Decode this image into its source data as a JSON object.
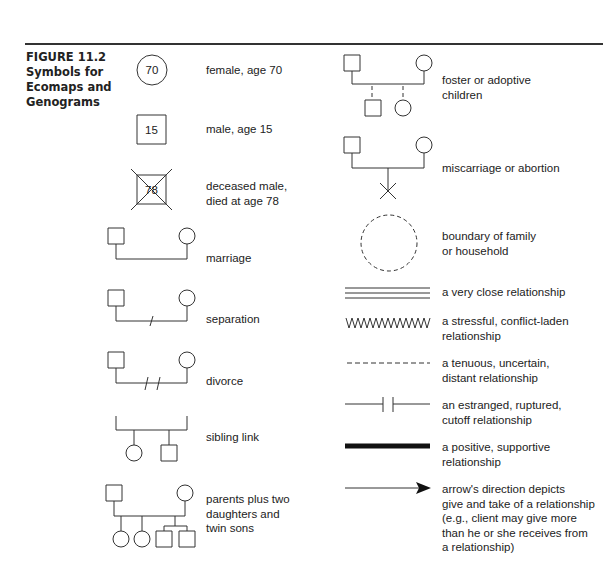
{
  "figure": {
    "number": "FIGURE 11.2",
    "title": "Symbols for Ecomaps and Genograms"
  },
  "left_column": [
    {
      "id": "female",
      "symbol": "circle",
      "symbol_text": "70",
      "label": "female, age 70"
    },
    {
      "id": "male",
      "symbol": "square",
      "symbol_text": "15",
      "label": "male, age 15"
    },
    {
      "id": "deceased",
      "symbol": "square-crossed",
      "symbol_text": "78",
      "label_lines": [
        "deceased male,",
        "died at age 78"
      ]
    },
    {
      "id": "marriage",
      "symbol": "marriage-line",
      "label": "marriage"
    },
    {
      "id": "separation",
      "symbol": "marriage-line-single-slash",
      "label": "separation"
    },
    {
      "id": "divorce",
      "symbol": "marriage-line-double-slash",
      "label": "divorce"
    },
    {
      "id": "sibling",
      "symbol": "sibling-bracket",
      "label": "sibling link"
    },
    {
      "id": "family",
      "symbol": "parents-with-children",
      "label_lines": [
        "parents plus two",
        "daughters and",
        "twin sons"
      ]
    }
  ],
  "right_column": [
    {
      "id": "foster",
      "symbol": "foster-dashed-children",
      "label_lines": [
        "foster or adoptive",
        "children"
      ]
    },
    {
      "id": "miscarriage",
      "symbol": "parents-with-x",
      "label": "miscarriage or abortion"
    },
    {
      "id": "boundary",
      "symbol": "dashed-circle",
      "label_lines": [
        "boundary of family",
        "or household"
      ]
    },
    {
      "id": "very-close",
      "symbol": "triple-line",
      "label": "a very close relationship"
    },
    {
      "id": "stressful",
      "symbol": "zigzag-line",
      "label_lines": [
        "a stressful, conflict-laden",
        "relationship"
      ]
    },
    {
      "id": "tenuous",
      "symbol": "dashed-line",
      "label_lines": [
        "a tenuous, uncertain,",
        "distant relationship"
      ]
    },
    {
      "id": "estranged",
      "symbol": "broken-line",
      "label_lines": [
        "an estranged, ruptured,",
        "cutoff relationship"
      ]
    },
    {
      "id": "positive",
      "symbol": "thick-line",
      "label_lines": [
        "a positive, supportive",
        "relationship"
      ]
    },
    {
      "id": "arrow",
      "symbol": "arrow-line",
      "label_lines": [
        "arrow's direction depicts",
        "give and take of a relationship",
        "(e.g., client may give more",
        "than he or she receives from",
        "a relationship)"
      ]
    }
  ],
  "colors": {
    "ink": "#222222",
    "background": "#ffffff"
  }
}
